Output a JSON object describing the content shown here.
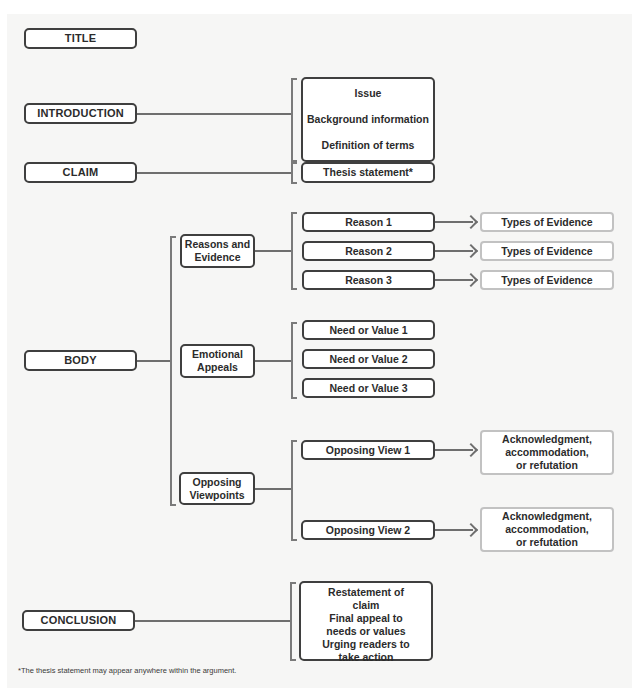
{
  "diagram": {
    "main_sections": {
      "title": "TITLE",
      "introduction": "INTRODUCTION",
      "claim": "CLAIM",
      "body": "BODY",
      "conclusion": "CONCLUSION"
    },
    "introduction_items": [
      "Issue",
      "Background information",
      "Definition of terms"
    ],
    "claim_item": "Thesis statement*",
    "body": {
      "reasons": {
        "label": "Reasons and Evidence",
        "items": [
          "Reason 1",
          "Reason 2",
          "Reason 3"
        ],
        "evidence": [
          "Types of Evidence",
          "Types of Evidence",
          "Types of Evidence"
        ]
      },
      "emotional": {
        "label": "Emotional Appeals",
        "items": [
          "Need or Value 1",
          "Need or Value 2",
          "Need or Value 3"
        ]
      },
      "opposing": {
        "label": "Opposing Viewpoints",
        "items": [
          "Opposing View 1",
          "Opposing View 2"
        ],
        "responses": [
          "Acknowledgment, accommodation, or refutation",
          "Acknowledgment, accommodation, or refutation"
        ]
      }
    },
    "conclusion_items": [
      "Restatement of claim",
      "Final appeal to needs or values",
      "Urging readers to take action"
    ],
    "footnote": "*The thesis statement may appear anywhere within the argument."
  },
  "colors": {
    "panel_bg": "#f6f6f5",
    "dark_border": "#3f3f3f",
    "light_border": "#c2c2c2",
    "connector": "#6e6e6e"
  }
}
